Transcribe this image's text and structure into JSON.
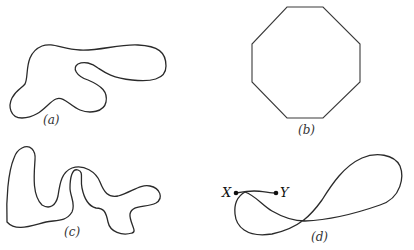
{
  "figure": {
    "panels": [
      {
        "id": "a",
        "label": "(a)",
        "description": "closed irregular curve"
      },
      {
        "id": "b",
        "label": "(b)",
        "description": "regular octagon"
      },
      {
        "id": "c",
        "label": "(c)",
        "description": "closed wiggly curve"
      },
      {
        "id": "d",
        "label": "(d)",
        "description": "figure-eight curve from X to Y"
      }
    ],
    "points": {
      "x_label": "X",
      "y_label": "Y"
    },
    "stroke_color": "#2a2a2a"
  }
}
